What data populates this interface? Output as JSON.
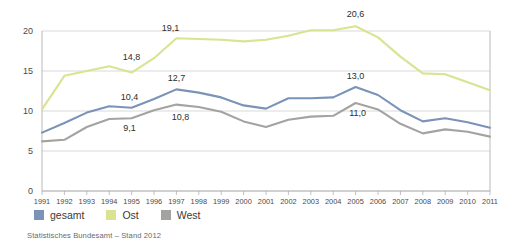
{
  "chart_data": {
    "type": "line",
    "title": "",
    "subtitle": "",
    "xlabel": "",
    "ylabel": "",
    "xlim": [
      1991,
      2011
    ],
    "ylim": [
      0,
      20
    ],
    "y_ticks": [
      "0",
      "5",
      "10",
      "15",
      "20"
    ],
    "grid": true,
    "legend_position": "bottom-left",
    "decimal_separator": ",",
    "categories": [
      "1991",
      "1992",
      "1993",
      "1994",
      "1995",
      "1996",
      "1997",
      "1998",
      "1999",
      "2000",
      "2001",
      "2002",
      "2003",
      "2004",
      "2005",
      "2006",
      "2007",
      "2008",
      "2009",
      "2010",
      "2011"
    ],
    "series": [
      {
        "name": "gesamt",
        "color": "#7b93b8",
        "values": [
          7.3,
          8.5,
          9.8,
          10.6,
          10.4,
          11.5,
          12.7,
          12.3,
          11.7,
          10.7,
          10.3,
          11.6,
          11.6,
          11.7,
          13.0,
          12.0,
          10.1,
          8.7,
          9.1,
          8.6,
          7.9
        ]
      },
      {
        "name": "Ost",
        "color": "#d9e391",
        "values": [
          10.2,
          14.4,
          15.0,
          15.6,
          14.8,
          16.6,
          19.1,
          19.0,
          18.9,
          18.7,
          18.9,
          19.4,
          20.1,
          20.1,
          20.6,
          19.2,
          16.8,
          14.7,
          14.6,
          13.6,
          12.6
        ]
      },
      {
        "name": "West",
        "color": "#a3a3a0",
        "values": [
          6.2,
          6.4,
          8.0,
          9.0,
          9.1,
          10.1,
          10.8,
          10.5,
          9.9,
          8.7,
          8.0,
          8.9,
          9.3,
          9.4,
          11.0,
          10.2,
          8.4,
          7.2,
          7.7,
          7.4,
          6.8
        ]
      }
    ],
    "annotations": [
      {
        "text": "14,8",
        "series": "Ost",
        "category": "1995",
        "value": 14.8,
        "dx": 0,
        "dy": -13
      },
      {
        "text": "19,1",
        "series": "Ost",
        "category": "1997",
        "value": 19.1,
        "dx": -6,
        "dy": -7
      },
      {
        "text": "20,6",
        "series": "Ost",
        "category": "2005",
        "value": 20.6,
        "dx": 0,
        "dy": -9
      },
      {
        "text": "10,4",
        "series": "gesamt",
        "category": "1995",
        "value": 10.4,
        "dx": -2,
        "dy": -8
      },
      {
        "text": "12,7",
        "series": "gesamt",
        "category": "1997",
        "value": 12.7,
        "dx": 0,
        "dy": -8
      },
      {
        "text": "13,0",
        "series": "gesamt",
        "category": "2005",
        "value": 13.0,
        "dx": 0,
        "dy": -8
      },
      {
        "text": "9,1",
        "series": "West",
        "category": "1995",
        "value": 9.1,
        "dx": -2,
        "dy": 13
      },
      {
        "text": "10,8",
        "series": "West",
        "category": "1997",
        "value": 10.8,
        "dx": 4,
        "dy": 15
      },
      {
        "text": "11,0",
        "series": "West",
        "category": "2005",
        "value": 11.0,
        "dx": 2,
        "dy": 13
      }
    ]
  },
  "legend": {
    "items": [
      {
        "label": "gesamt",
        "color": "#7b93b8"
      },
      {
        "label": "Ost",
        "color": "#d9e391"
      },
      {
        "label": "West",
        "color": "#a3a3a0"
      }
    ]
  },
  "footer": {
    "source": "Statistisches Bundesamt – Stand 2012"
  }
}
